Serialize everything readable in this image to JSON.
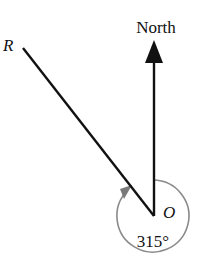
{
  "diagram": {
    "type": "bearing-diagram",
    "north_label": "North",
    "point_r_label": "R",
    "origin_label": "O",
    "angle_label": "315°",
    "angle_degrees": 315,
    "colors": {
      "lines": "#111111",
      "arc": "#8a8a8a",
      "background": "#ffffff"
    }
  }
}
